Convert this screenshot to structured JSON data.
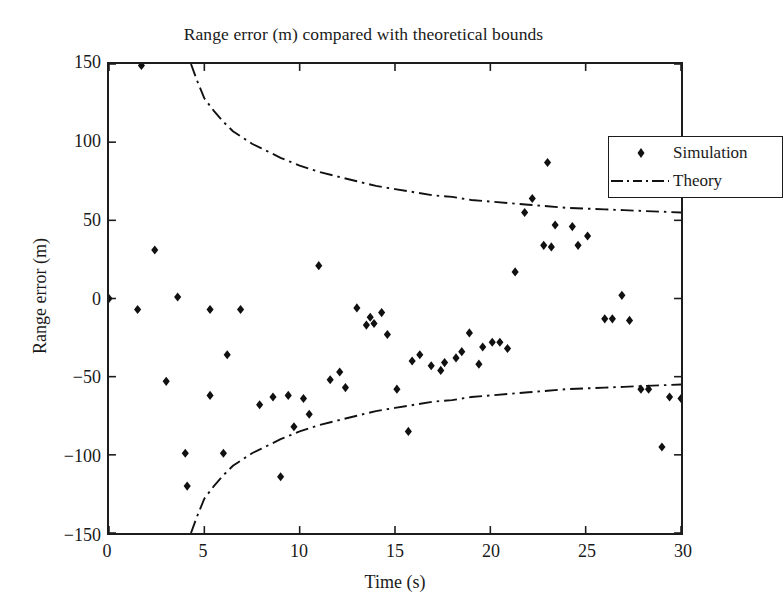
{
  "chart_data": {
    "type": "scatter",
    "title": "Range error (m) compared with theoretical bounds",
    "xlabel": "Time (s)",
    "ylabel": "Range error (m)",
    "xlim": [
      0,
      30
    ],
    "ylim": [
      -150,
      150
    ],
    "xticks": [
      0,
      5,
      10,
      15,
      20,
      25,
      30
    ],
    "yticks": [
      -150,
      -100,
      -50,
      0,
      50,
      100,
      150
    ],
    "grid": false,
    "legend_position": "top-right",
    "legend": [
      {
        "label": "Simulation",
        "style": "marker",
        "marker": "diamond",
        "color": "#111111"
      },
      {
        "label": "Theory",
        "style": "dash-dot-line",
        "color": "#111111"
      }
    ],
    "series": [
      {
        "name": "Simulation",
        "type": "scatter",
        "marker": "diamond",
        "color": "#111111",
        "points": [
          [
            0.0,
            0.0
          ],
          [
            1.5,
            -7.0
          ],
          [
            1.7,
            149.0
          ],
          [
            2.4,
            31.0
          ],
          [
            3.0,
            -53.0
          ],
          [
            3.6,
            1.0
          ],
          [
            4.0,
            -99.0
          ],
          [
            4.1,
            -120.0
          ],
          [
            5.3,
            -7.0
          ],
          [
            5.3,
            -62.0
          ],
          [
            6.0,
            -99.0
          ],
          [
            6.2,
            -36.0
          ],
          [
            6.9,
            -7.0
          ],
          [
            7.9,
            -68.0
          ],
          [
            8.6,
            -63.0
          ],
          [
            9.0,
            -114.0
          ],
          [
            9.4,
            -62.0
          ],
          [
            9.7,
            -82.0
          ],
          [
            10.2,
            -64.0
          ],
          [
            10.5,
            -74.0
          ],
          [
            11.0,
            21.0
          ],
          [
            11.6,
            -52.0
          ],
          [
            12.1,
            -47.0
          ],
          [
            12.4,
            -57.0
          ],
          [
            13.0,
            -6.0
          ],
          [
            13.5,
            -17.0
          ],
          [
            13.7,
            -12.0
          ],
          [
            13.9,
            -16.0
          ],
          [
            14.3,
            -9.0
          ],
          [
            14.6,
            -23.0
          ],
          [
            15.1,
            -58.0
          ],
          [
            15.7,
            -85.0
          ],
          [
            15.9,
            -40.0
          ],
          [
            16.3,
            -36.0
          ],
          [
            16.9,
            -43.0
          ],
          [
            17.4,
            -46.0
          ],
          [
            17.6,
            -41.0
          ],
          [
            18.2,
            -38.0
          ],
          [
            18.5,
            -34.0
          ],
          [
            18.9,
            -22.0
          ],
          [
            19.4,
            -42.0
          ],
          [
            19.6,
            -31.0
          ],
          [
            20.1,
            -28.0
          ],
          [
            20.5,
            -28.0
          ],
          [
            20.9,
            -32.0
          ],
          [
            21.3,
            17.0
          ],
          [
            21.8,
            55.0
          ],
          [
            22.2,
            64.0
          ],
          [
            22.8,
            34.0
          ],
          [
            23.0,
            87.0
          ],
          [
            23.2,
            33.0
          ],
          [
            23.4,
            47.0
          ],
          [
            24.3,
            46.0
          ],
          [
            24.6,
            34.0
          ],
          [
            25.1,
            40.0
          ],
          [
            26.0,
            -13.0
          ],
          [
            26.4,
            -13.0
          ],
          [
            26.9,
            2.0
          ],
          [
            27.3,
            -14.0
          ],
          [
            27.9,
            -58.0
          ],
          [
            28.3,
            -58.0
          ],
          [
            29.0,
            -95.0
          ],
          [
            29.4,
            -63.0
          ],
          [
            30.0,
            -64.0
          ]
        ]
      },
      {
        "name": "Theory (upper bound)",
        "type": "line",
        "style": "dash-dot",
        "color": "#111111",
        "points": [
          [
            4.3,
            150.0
          ],
          [
            4.6,
            140.0
          ],
          [
            5.0,
            128.0
          ],
          [
            5.5,
            120.0
          ],
          [
            6.0,
            113.0
          ],
          [
            6.5,
            107.0
          ],
          [
            7.0,
            103.0
          ],
          [
            7.5,
            99.0
          ],
          [
            8.0,
            96.0
          ],
          [
            9.0,
            90.0
          ],
          [
            10.0,
            85.0
          ],
          [
            11.0,
            81.0
          ],
          [
            12.0,
            78.0
          ],
          [
            13.0,
            75.0
          ],
          [
            14.0,
            72.0
          ],
          [
            15.0,
            70.0
          ],
          [
            16.0,
            68.0
          ],
          [
            17.0,
            66.0
          ],
          [
            18.0,
            65.0
          ],
          [
            19.0,
            63.0
          ],
          [
            20.0,
            62.0
          ],
          [
            21.0,
            61.0
          ],
          [
            22.0,
            60.0
          ],
          [
            23.0,
            59.0
          ],
          [
            24.0,
            58.0
          ],
          [
            25.0,
            57.5
          ],
          [
            26.0,
            57.0
          ],
          [
            27.0,
            56.5
          ],
          [
            28.0,
            56.0
          ],
          [
            29.0,
            55.5
          ],
          [
            30.0,
            55.0
          ]
        ]
      },
      {
        "name": "Theory (lower bound)",
        "type": "line",
        "style": "dash-dot",
        "color": "#111111",
        "points": [
          [
            4.3,
            -150.0
          ],
          [
            4.6,
            -140.0
          ],
          [
            5.0,
            -128.0
          ],
          [
            5.5,
            -120.0
          ],
          [
            6.0,
            -113.0
          ],
          [
            6.5,
            -107.0
          ],
          [
            7.0,
            -103.0
          ],
          [
            7.5,
            -99.0
          ],
          [
            8.0,
            -96.0
          ],
          [
            9.0,
            -90.0
          ],
          [
            10.0,
            -85.0
          ],
          [
            11.0,
            -81.0
          ],
          [
            12.0,
            -78.0
          ],
          [
            13.0,
            -75.0
          ],
          [
            14.0,
            -72.0
          ],
          [
            15.0,
            -70.0
          ],
          [
            16.0,
            -68.0
          ],
          [
            17.0,
            -66.0
          ],
          [
            18.0,
            -65.0
          ],
          [
            19.0,
            -63.0
          ],
          [
            20.0,
            -62.0
          ],
          [
            21.0,
            -61.0
          ],
          [
            22.0,
            -60.0
          ],
          [
            23.0,
            -59.0
          ],
          [
            24.0,
            -58.0
          ],
          [
            25.0,
            -57.5
          ],
          [
            26.0,
            -57.0
          ],
          [
            27.0,
            -56.5
          ],
          [
            28.0,
            -56.0
          ],
          [
            29.0,
            -55.5
          ],
          [
            30.0,
            -55.0
          ]
        ]
      }
    ]
  }
}
